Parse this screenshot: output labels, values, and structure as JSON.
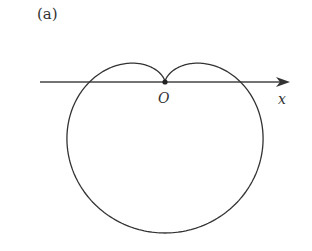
{
  "figure": {
    "panel_label": "(a)",
    "origin_label": "O",
    "axis_label": "x",
    "curve": {
      "type": "cardioid",
      "equation_form": "r = a(1 - sin θ)",
      "cusp": [
        165,
        82
      ],
      "a": 75.5
    },
    "axis": {
      "y": 82,
      "x_start": 40,
      "x_end": 290
    },
    "colors": {
      "stroke": "#333333",
      "background": "#ffffff"
    }
  }
}
